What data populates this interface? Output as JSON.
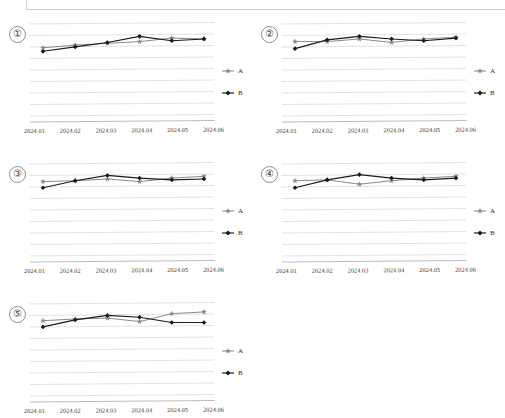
{
  "page": {
    "kind": "scanned-document-page",
    "background_color": "#ffffff"
  },
  "legend": {
    "series_a_label": "A",
    "series_b_label": "B",
    "series_a_marker": "star-marker-icon",
    "series_b_marker": "diamond-marker-icon"
  },
  "colors": {
    "series_a": "#8a8a8a",
    "series_b": "#1a1a1a",
    "gridline": "#d5d5d5",
    "axis": "#bdbdbd",
    "text": "#2a2a2a"
  },
  "panels": [
    {
      "index_label": "①"
    },
    {
      "index_label": "②"
    },
    {
      "index_label": "③"
    },
    {
      "index_label": "④"
    },
    {
      "index_label": "⑤"
    }
  ],
  "chart_data": [
    {
      "type": "line",
      "title": "①",
      "xlabel": "",
      "ylabel": "",
      "grid": true,
      "legend_position": "right",
      "categories": [
        "2024.01",
        "2024.02",
        "2024.03",
        "2024.04",
        "2024.05",
        "2024.06"
      ],
      "ylim": [
        0,
        10
      ],
      "series": [
        {
          "name": "A",
          "values": [
            7.3,
            7.6,
            7.8,
            8.0,
            8.4,
            8.3
          ]
        },
        {
          "name": "B",
          "values": [
            6.9,
            7.4,
            7.9,
            8.6,
            8.1,
            8.3
          ]
        }
      ]
    },
    {
      "type": "line",
      "title": "②",
      "xlabel": "",
      "ylabel": "",
      "grid": true,
      "legend_position": "right",
      "categories": [
        "2024.01",
        "2024.02",
        "2024.03",
        "2024.04",
        "2024.05",
        "2024.06"
      ],
      "ylim": [
        0,
        10
      ],
      "series": [
        {
          "name": "A",
          "values": [
            8.0,
            8.0,
            8.3,
            7.9,
            8.3,
            8.5
          ]
        },
        {
          "name": "B",
          "values": [
            7.2,
            8.2,
            8.6,
            8.3,
            8.1,
            8.4
          ]
        }
      ]
    },
    {
      "type": "line",
      "title": "③",
      "xlabel": "",
      "ylabel": "",
      "grid": true,
      "legend_position": "right",
      "categories": [
        "2024.01",
        "2024.02",
        "2024.03",
        "2024.04",
        "2024.05",
        "2024.06"
      ],
      "ylim": [
        0,
        10
      ],
      "series": [
        {
          "name": "A",
          "values": [
            8.0,
            8.1,
            8.3,
            8.0,
            8.4,
            8.6
          ]
        },
        {
          "name": "B",
          "values": [
            7.3,
            8.1,
            8.7,
            8.4,
            8.2,
            8.3
          ]
        }
      ]
    },
    {
      "type": "line",
      "title": "④",
      "xlabel": "",
      "ylabel": "",
      "grid": true,
      "legend_position": "right",
      "categories": [
        "2024.01",
        "2024.02",
        "2024.03",
        "2024.04",
        "2024.05",
        "2024.06"
      ],
      "ylim": [
        0,
        10
      ],
      "series": [
        {
          "name": "A",
          "values": [
            8.1,
            8.2,
            7.7,
            8.1,
            8.4,
            8.6
          ]
        },
        {
          "name": "B",
          "values": [
            7.3,
            8.2,
            8.8,
            8.4,
            8.2,
            8.4
          ]
        }
      ]
    },
    {
      "type": "line",
      "title": "⑤",
      "xlabel": "",
      "ylabel": "",
      "grid": true,
      "legend_position": "right",
      "categories": [
        "2024.01",
        "2024.02",
        "2024.03",
        "2024.04",
        "2024.05",
        "2024.06"
      ],
      "ylim": [
        0,
        10
      ],
      "series": [
        {
          "name": "A",
          "values": [
            8.1,
            8.3,
            8.4,
            8.0,
            8.9,
            9.1
          ]
        },
        {
          "name": "B",
          "values": [
            7.4,
            8.2,
            8.7,
            8.5,
            7.9,
            7.9
          ]
        }
      ]
    }
  ]
}
